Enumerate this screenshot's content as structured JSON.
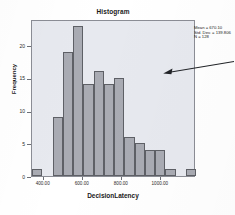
{
  "chart_data": {
    "type": "bar",
    "title": "Histogram",
    "xlabel": "DecisionLatency",
    "ylabel": "Frequency",
    "grid": false,
    "legend": null,
    "xlim": [
      340,
      1180
    ],
    "ylim": [
      0,
      24
    ],
    "bin_width": 52.5,
    "bin_starts": [
      340,
      392.5,
      445,
      497.5,
      550,
      602.5,
      655,
      707.5,
      760,
      812.5,
      865,
      917.5,
      970,
      1022.5,
      1075,
      1127.5
    ],
    "categories": [
      "340-392",
      "392-445",
      "445-498",
      "498-550",
      "550-602",
      "602-655",
      "655-708",
      "708-760",
      "760-812",
      "812-865",
      "865-918",
      "918-970",
      "970-1022",
      "1022-1075",
      "1075-1128",
      "1128-1180"
    ],
    "values": [
      1,
      0,
      9,
      19,
      23,
      14,
      16,
      14,
      15,
      6,
      5,
      4,
      4,
      1,
      0,
      1
    ],
    "xticks": [
      400,
      600,
      800,
      1000
    ],
    "xtick_labels": [
      "400.00",
      "600.00",
      "800.00",
      "1000.00"
    ],
    "yticks": [
      0,
      5,
      10,
      15,
      20
    ],
    "ytick_labels": [
      "0",
      "5",
      "10",
      "15",
      "20"
    ],
    "annotations": {
      "stats": [
        "Mean = 670.10",
        "Std. Dev. = 139.806",
        "N = 128"
      ],
      "pointer": "arrow-pointing-left-into-plot"
    },
    "colors": {
      "bar_fill": "#a9abb3",
      "bar_edge": "#5e6066",
      "plot_background": "#e7e9ef",
      "frame": "#8b8d95",
      "text": "#1a1a1a",
      "page_background": "#ffffff"
    }
  },
  "stats_box": {
    "mean": "Mean = 670.10",
    "std_dev": "Std. Dev. = 139.806",
    "n": "N = 128"
  }
}
